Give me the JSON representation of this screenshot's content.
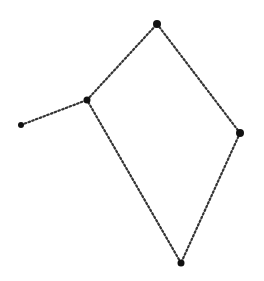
{
  "diagram": {
    "type": "graph",
    "background": "#ffffff",
    "edge_style": "dotted",
    "edge_color": "#333333",
    "node_color": "#111111",
    "nodes": [
      {
        "id": "top",
        "x": 157,
        "y": 24,
        "r": 4
      },
      {
        "id": "junction",
        "x": 87,
        "y": 100,
        "r": 3.5
      },
      {
        "id": "left-end",
        "x": 21,
        "y": 125,
        "r": 3
      },
      {
        "id": "right",
        "x": 240,
        "y": 133,
        "r": 4
      },
      {
        "id": "bottom",
        "x": 181,
        "y": 263,
        "r": 3.5
      }
    ],
    "edges": [
      {
        "from": "left-end",
        "to": "junction"
      },
      {
        "from": "junction",
        "to": "top"
      },
      {
        "from": "top",
        "to": "right"
      },
      {
        "from": "right",
        "to": "bottom"
      },
      {
        "from": "bottom",
        "to": "junction"
      }
    ]
  }
}
